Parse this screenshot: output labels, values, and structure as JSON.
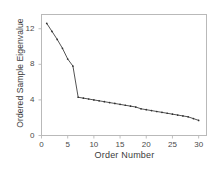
{
  "chart_data": {
    "type": "line",
    "title": "",
    "subtitle": "",
    "xlabel": "Order Number",
    "ylabel": "Ordered Sample Eigenvalue",
    "xlim": [
      0,
      31.5
    ],
    "ylim": [
      0,
      13.6
    ],
    "xticks": [
      0,
      5,
      10,
      15,
      20,
      25,
      30
    ],
    "xtick_labels": [
      "0",
      "5",
      "10",
      "15",
      "20",
      "25",
      "30"
    ],
    "yticks": [
      0,
      4,
      8,
      12
    ],
    "ytick_labels": [
      "0",
      "4",
      "8",
      "12"
    ],
    "grid": false,
    "legend": null,
    "legend_position": "none",
    "marker": "dot",
    "line_color": "#404040",
    "marker_color": "#303030",
    "frame_color": "#b9b9b9",
    "x": [
      1,
      2,
      3,
      4,
      5,
      6,
      7,
      8,
      9,
      10,
      11,
      12,
      13,
      14,
      15,
      16,
      17,
      18,
      19,
      20,
      21,
      22,
      23,
      24,
      25,
      26,
      27,
      28,
      29,
      30
    ],
    "values": [
      12.6,
      11.7,
      10.8,
      9.8,
      8.6,
      7.8,
      4.3,
      4.2,
      4.1,
      4.0,
      3.9,
      3.8,
      3.7,
      3.6,
      3.5,
      3.4,
      3.3,
      3.2,
      3.0,
      2.9,
      2.8,
      2.7,
      2.6,
      2.5,
      2.4,
      2.3,
      2.2,
      2.1,
      1.9,
      1.7
    ],
    "series": [
      {
        "name": "Ordered Sample Eigenvalue",
        "values": [
          12.6,
          11.7,
          10.8,
          9.8,
          8.6,
          7.8,
          4.3,
          4.2,
          4.1,
          4.0,
          3.9,
          3.8,
          3.7,
          3.6,
          3.5,
          3.4,
          3.3,
          3.2,
          3.0,
          2.9,
          2.8,
          2.7,
          2.6,
          2.5,
          2.4,
          2.3,
          2.2,
          2.1,
          1.9,
          1.7
        ]
      }
    ]
  }
}
